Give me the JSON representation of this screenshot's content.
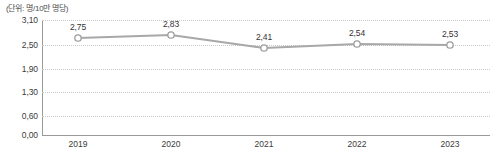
{
  "chart_data": {
    "type": "line",
    "title": "",
    "subtitle": "",
    "unit_caption": "(단위: 명/10만 명당)",
    "xlabel": "",
    "ylabel": "",
    "categories": [
      "2019",
      "2020",
      "2021",
      "2022",
      "2023"
    ],
    "values": [
      2.75,
      2.83,
      2.41,
      2.54,
      2.53
    ],
    "point_labels": [
      "2,75",
      "2,83",
      "2,41",
      "2,54",
      "2,53"
    ],
    "series": [
      {
        "name": "",
        "values": [
          2.75,
          2.83,
          2.41,
          2.54,
          2.53
        ]
      }
    ],
    "ytick_labels": [
      "3,10",
      "2,50",
      "1,90",
      "1,30",
      "0,60",
      "0,00"
    ],
    "ytick_values": [
      3.1,
      2.5,
      1.9,
      1.3,
      0.6,
      0.0
    ],
    "ylim": [
      0.0,
      3.1
    ],
    "grid": true,
    "grid_style": "dotted-horizontal",
    "legend": false,
    "legend_position": "none",
    "marker": "open-circle",
    "colors": {
      "line": "#a8a8a8",
      "marker_stroke": "#9d9d9d",
      "marker_fill": "#ffffff",
      "grid": "#c9c9c9",
      "axis": "#9a9a9a",
      "text": "#3c3c3c",
      "background": "#ffffff"
    },
    "plot_geometry": {
      "x_positions": [
        78,
        171,
        264,
        357,
        450
      ],
      "y_positions": [
        38,
        35,
        48,
        44,
        45
      ],
      "grid_y_positions": [
        20,
        45,
        69,
        92,
        116,
        135
      ],
      "plot_left": 42,
      "plot_right": 490,
      "plot_top": 20,
      "plot_bottom": 135
    }
  }
}
